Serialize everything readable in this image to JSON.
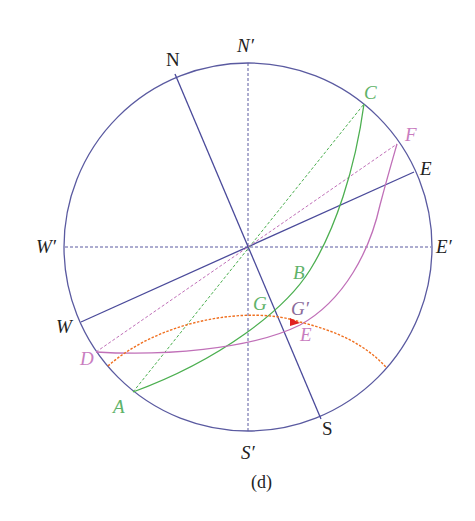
{
  "caption": "(d)",
  "colors": {
    "circle": "#5a5aa0",
    "axes": "#4a4a9a",
    "green": "#4caf50",
    "pink": "#c070b8",
    "orange": "#f07020",
    "arrow": "#e02020",
    "text_black": "#222222",
    "text_green": "#5fb36a",
    "text_pink": "#c97dbf",
    "text_purple": "#8a6a9a"
  },
  "labels": {
    "N": "N",
    "S": "S",
    "N_prime": "N′",
    "S_prime": "S′",
    "W": "W",
    "E": "E",
    "W_prime": "W′",
    "E_prime": "E′",
    "A": "A",
    "B": "B",
    "C": "C",
    "D": "D",
    "E_pink": "E",
    "F": "F",
    "G": "G",
    "G_prime": "G′"
  },
  "geometry": {
    "center": [
      248,
      247
    ],
    "radius": 184,
    "points": {
      "N": [
        175,
        74
      ],
      "S": [
        321,
        419
      ],
      "W": [
        81,
        322
      ],
      "E": [
        414,
        172
      ],
      "N_prime": [
        248,
        61
      ],
      "S_prime": [
        248,
        433
      ],
      "W_prime": [
        64,
        247
      ],
      "E_prime": [
        431,
        247
      ],
      "A": [
        133,
        392
      ],
      "C": [
        364,
        104
      ],
      "D": [
        96,
        352
      ],
      "F": [
        397,
        144
      ],
      "G_prime": [
        298,
        322
      ]
    }
  }
}
